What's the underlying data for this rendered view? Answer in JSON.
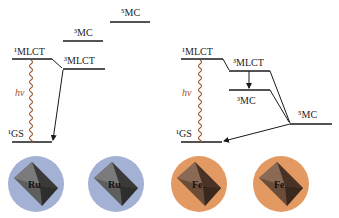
{
  "colors": {
    "level_line": "#1a1a1a",
    "wavy": "#a0522d",
    "ru_circle": "#a3b1d4",
    "fe_circle": "#e39a62",
    "ru_octahedron_light": "#6b6b6b",
    "ru_octahedron_dark": "#3a3a3a",
    "fe_octahedron_light": "#7a5a45",
    "fe_octahedron_dark": "#4a3326"
  },
  "left_panel": {
    "levels": {
      "mlct1": "¹MLCT",
      "mlct3": "³MLCT",
      "mc3": "³MC",
      "mc5": "⁵MC",
      "gs1": "¹GS"
    },
    "excitation_label": "hv"
  },
  "right_panel": {
    "levels": {
      "mlct1": "¹MLCT",
      "mlct3": "³MLCT",
      "mc3": "³MC",
      "mc5": "⁵MC",
      "gs1": "¹GS"
    },
    "excitation_label": "hv"
  },
  "complexes": [
    {
      "metal": "Ru"
    },
    {
      "metal": "Ru"
    },
    {
      "metal": "Fe"
    },
    {
      "metal": "Fe"
    }
  ]
}
